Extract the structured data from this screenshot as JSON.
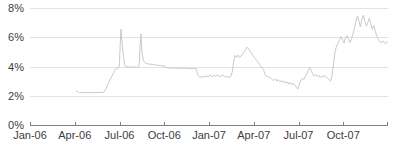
{
  "chart_data": {
    "type": "line",
    "title": "",
    "xlabel": "",
    "ylabel": "",
    "grid": true,
    "legend": false,
    "ylim": [
      0,
      8
    ],
    "ytick_labels": [
      "0%",
      "2%",
      "4%",
      "6%",
      "8%"
    ],
    "ytick_values": [
      0,
      2,
      4,
      6,
      8
    ],
    "xtick_labels": [
      "Jan-06",
      "Apr-06",
      "Jul-06",
      "Oct-06",
      "Jan-07",
      "Apr-07",
      "Jul-07",
      "Oct-07"
    ],
    "xtick_values": [
      0,
      3,
      6,
      9,
      12,
      15,
      18,
      21
    ],
    "xlim": [
      0,
      24
    ],
    "series": [
      {
        "name": "rate",
        "color": "#c9c9c9",
        "x": [
          3.1,
          3.18,
          3.25,
          3.32,
          3.45,
          3.6,
          3.8,
          4.0,
          4.2,
          4.4,
          4.6,
          4.8,
          4.95,
          5.05,
          5.15,
          5.25,
          5.35,
          5.45,
          5.55,
          5.62,
          5.68,
          5.72,
          5.76,
          5.8,
          5.84,
          5.88,
          5.92,
          5.96,
          6.0,
          6.05,
          6.1,
          6.2,
          6.35,
          6.5,
          6.65,
          6.8,
          6.95,
          7.05,
          7.15,
          7.22,
          7.28,
          7.33,
          7.38,
          7.44,
          7.5,
          7.6,
          7.75,
          7.9,
          8.05,
          8.2,
          8.35,
          8.5,
          8.65,
          8.8,
          8.95,
          9.05,
          9.12,
          9.18,
          9.25,
          9.35,
          9.45,
          9.55,
          9.65,
          9.75,
          9.85,
          9.95,
          10.05,
          10.15,
          10.25,
          10.35,
          10.45,
          10.55,
          10.65,
          10.75,
          10.85,
          10.95,
          11.05,
          11.15,
          11.25,
          11.35,
          11.45,
          11.55,
          11.65,
          11.72,
          11.8,
          11.88,
          11.95,
          12.05,
          12.15,
          12.25,
          12.35,
          12.45,
          12.55,
          12.65,
          12.75,
          12.85,
          12.95,
          13.05,
          13.15,
          13.25,
          13.35,
          13.45,
          13.55,
          13.65,
          13.75,
          13.85,
          13.95,
          14.05,
          14.15,
          14.25,
          14.35,
          14.45,
          14.55,
          14.65,
          14.75,
          14.85,
          14.95,
          15.05,
          15.15,
          15.25,
          15.35,
          15.45,
          15.55,
          15.65,
          15.75,
          15.85,
          15.95,
          16.05,
          16.15,
          16.25,
          16.35,
          16.45,
          16.55,
          16.65,
          16.75,
          16.85,
          16.95,
          17.05,
          17.15,
          17.25,
          17.35,
          17.45,
          17.55,
          17.65,
          17.75,
          17.85,
          17.95,
          18.05,
          18.15,
          18.25,
          18.35,
          18.45,
          18.55,
          18.65,
          18.75,
          18.85,
          18.95,
          19.05,
          19.15,
          19.25,
          19.35,
          19.45,
          19.55,
          19.65,
          19.75,
          19.85,
          19.95,
          20.05,
          20.15,
          20.25,
          20.35,
          20.45,
          20.55,
          20.65,
          20.75,
          20.85,
          20.95,
          21.05,
          21.15,
          21.25,
          21.35,
          21.45,
          21.55,
          21.65,
          21.75,
          21.85,
          21.95,
          22.05,
          22.15,
          22.25,
          22.35,
          22.45,
          22.55,
          22.65,
          22.75,
          22.85,
          22.95,
          23.05,
          23.15,
          23.25,
          23.35,
          23.45,
          23.55,
          23.65,
          23.75,
          23.85,
          23.95
        ],
        "y": [
          2.32,
          2.3,
          2.22,
          2.22,
          2.22,
          2.22,
          2.22,
          2.22,
          2.22,
          2.22,
          2.22,
          2.22,
          2.25,
          2.4,
          2.6,
          2.85,
          3.05,
          3.25,
          3.45,
          3.6,
          3.72,
          3.8,
          3.82,
          3.84,
          3.86,
          3.88,
          3.9,
          3.92,
          4.3,
          5.6,
          6.55,
          5.3,
          4.05,
          3.98,
          3.96,
          3.96,
          3.96,
          3.96,
          3.96,
          3.96,
          3.96,
          4.2,
          5.4,
          6.22,
          5.0,
          4.4,
          4.22,
          4.18,
          4.16,
          4.14,
          4.12,
          4.1,
          4.08,
          4.06,
          4.04,
          4.02,
          3.95,
          3.92,
          3.9,
          3.9,
          3.9,
          3.9,
          3.9,
          3.9,
          3.88,
          3.88,
          3.88,
          3.88,
          3.88,
          3.88,
          3.88,
          3.88,
          3.86,
          3.86,
          3.86,
          3.86,
          3.86,
          3.84,
          3.4,
          3.3,
          3.28,
          3.32,
          3.26,
          3.34,
          3.28,
          3.38,
          3.3,
          3.42,
          3.36,
          3.3,
          3.4,
          3.34,
          3.44,
          3.36,
          3.3,
          3.42,
          3.38,
          3.32,
          3.28,
          3.3,
          3.26,
          3.3,
          3.6,
          4.3,
          4.75,
          4.62,
          4.78,
          4.6,
          4.72,
          4.85,
          5.0,
          5.15,
          5.32,
          5.2,
          5.05,
          4.9,
          4.75,
          4.6,
          4.5,
          4.35,
          4.2,
          4.05,
          3.9,
          3.8,
          3.45,
          3.35,
          3.3,
          3.25,
          3.2,
          3.1,
          3.05,
          3.15,
          3.0,
          3.1,
          2.95,
          3.05,
          2.9,
          3.0,
          2.85,
          2.95,
          2.8,
          2.9,
          2.75,
          2.85,
          2.7,
          2.6,
          2.45,
          2.8,
          3.0,
          3.2,
          3.1,
          3.3,
          3.5,
          3.7,
          3.95,
          3.75,
          3.5,
          3.35,
          3.45,
          3.3,
          3.4,
          3.25,
          3.35,
          3.28,
          3.4,
          3.3,
          3.2,
          3.1,
          3.0,
          3.4,
          4.2,
          5.0,
          5.4,
          5.6,
          5.85,
          6.05,
          5.8,
          5.6,
          5.95,
          6.1,
          5.85,
          5.65,
          5.9,
          6.2,
          6.6,
          7.1,
          7.45,
          7.1,
          6.7,
          7.25,
          7.5,
          7.1,
          6.75,
          7.0,
          7.3,
          6.9,
          6.55,
          6.8,
          6.4,
          6.1,
          5.85,
          5.7,
          5.6,
          5.75,
          5.65,
          5.55,
          5.7
        ]
      }
    ]
  },
  "axes": {
    "plot_left": 30,
    "plot_right": 388,
    "plot_top": 8,
    "plot_bottom": 125
  }
}
